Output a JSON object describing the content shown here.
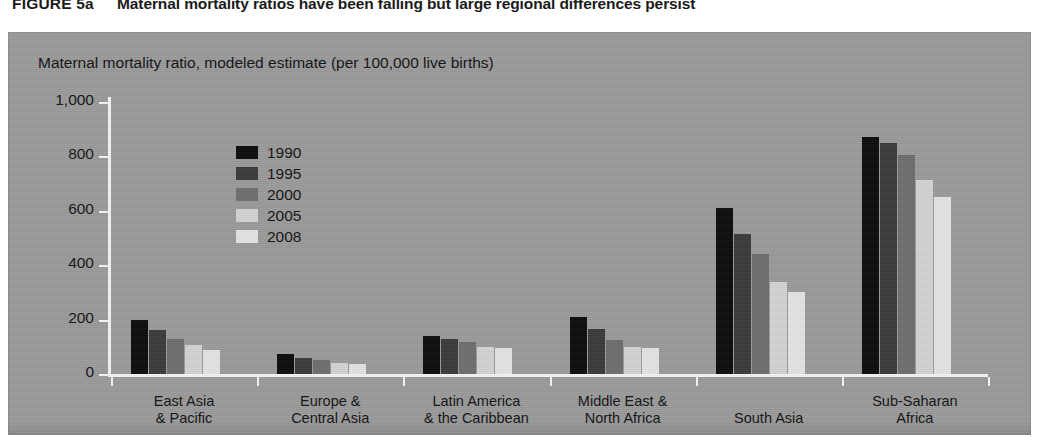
{
  "figure": {
    "label": "FIGURE 5a",
    "title": "Maternal mortality ratios have been falling but large regional differences persist"
  },
  "colors": {
    "panel_background": "#9a9a9a",
    "axis": "#f2f2f2",
    "series": [
      "#0d0d0d",
      "#3b3b3b",
      "#6e6e6e",
      "#d2d2d2",
      "#e2e2e2"
    ]
  },
  "chart_data": {
    "type": "bar",
    "title": "Maternal mortality ratios have been falling but large regional differences persist",
    "subtitle": "Maternal mortality ratio, modeled estimate (per 100,000 live births)",
    "xlabel": "",
    "ylabel": "Maternal mortality ratio, modeled estimate (per 100,000 live births)",
    "ylim": [
      0,
      1000
    ],
    "yticks": [
      0,
      200,
      400,
      600,
      800,
      1000
    ],
    "ytick_labels": [
      "0",
      "200",
      "400",
      "600",
      "800",
      "1,000"
    ],
    "grid": false,
    "legend_position": "inside-upper-left",
    "categories": [
      "East Asia\n& Pacific",
      "Europe &\nCentral Asia",
      "Latin America\n& the Caribbean",
      "Middle East &\nNorth Africa",
      "South Asia",
      "Sub-Saharan\nAfrica"
    ],
    "category_lines": [
      [
        "East Asia",
        "& Pacific"
      ],
      [
        "Europe &",
        "Central Asia"
      ],
      [
        "Latin America",
        "& the Caribbean"
      ],
      [
        "Middle East &",
        "North Africa"
      ],
      [
        "South Asia",
        ""
      ],
      [
        "Sub-Saharan",
        "Africa"
      ]
    ],
    "series": [
      {
        "name": "1990",
        "color": "#0d0d0d",
        "values": [
          200,
          72,
          140,
          210,
          610,
          870
        ]
      },
      {
        "name": "1995",
        "color": "#3b3b3b",
        "values": [
          163,
          60,
          130,
          165,
          515,
          850
        ]
      },
      {
        "name": "2000",
        "color": "#6e6e6e",
        "values": [
          130,
          50,
          118,
          125,
          440,
          805
        ]
      },
      {
        "name": "2005",
        "color": "#d2d2d2",
        "values": [
          108,
          40,
          100,
          100,
          340,
          715
        ]
      },
      {
        "name": "2008",
        "color": "#e2e2e2",
        "values": [
          89,
          38,
          94,
          95,
          300,
          650
        ]
      }
    ]
  },
  "legend": {
    "items": [
      {
        "label": "1990"
      },
      {
        "label": "1995"
      },
      {
        "label": "2000"
      },
      {
        "label": "2005"
      },
      {
        "label": "2008"
      }
    ]
  }
}
